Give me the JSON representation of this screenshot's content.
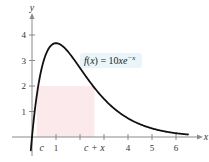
{
  "chart_data": {
    "type": "line",
    "title": "",
    "xlabel": "x",
    "ylabel": "y",
    "function_label": {
      "prefix": "f(x) = 10xe",
      "exponent": "−x"
    },
    "series": [
      {
        "name": "f(x) = 10xe^(-x)",
        "x": [
          0,
          0.25,
          0.5,
          0.75,
          1,
          1.5,
          2,
          2.5,
          3,
          3.5,
          4,
          4.5,
          5,
          5.5,
          6,
          6.5
        ],
        "values": [
          0,
          1.95,
          3.03,
          3.54,
          3.68,
          3.35,
          2.71,
          2.05,
          1.49,
          1.06,
          0.73,
          0.5,
          0.34,
          0.22,
          0.15,
          0.1
        ]
      }
    ],
    "shaded_rectangle": {
      "x_from_label": "c",
      "x_to_label": "c + x",
      "x_from": 0.2,
      "x_to": 2.6,
      "height": 2,
      "color": "#fbe9ec"
    },
    "x_ticks": [
      {
        "value": 1,
        "label": "1"
      },
      {
        "value": 2,
        "label": ""
      },
      {
        "value": 3,
        "label": ""
      },
      {
        "value": 4,
        "label": "4"
      },
      {
        "value": 5,
        "label": "5"
      },
      {
        "value": 6,
        "label": "6"
      }
    ],
    "x_special_labels": [
      {
        "value": 0.2,
        "label": "c"
      },
      {
        "value": 2.6,
        "label": "c + x"
      }
    ],
    "y_ticks": [
      {
        "value": 1,
        "label": "1"
      },
      {
        "value": 2,
        "label": "2"
      },
      {
        "value": 3,
        "label": "3"
      },
      {
        "value": 4,
        "label": "4"
      }
    ],
    "xlim": [
      -0.2,
      6.9
    ],
    "ylim": [
      -0.6,
      4.7
    ],
    "grid": false,
    "legend": "none",
    "label_background": "#e8f4f8"
  }
}
